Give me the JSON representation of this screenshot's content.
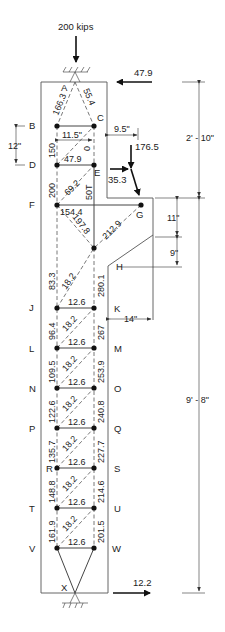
{
  "diagram": {
    "loads": {
      "top_axial": "200 kips",
      "top_horizontal": "47.9",
      "corbel_vertical": "176.5",
      "corbel_horizontal": "35.3",
      "bottom_horizontal": "12.2"
    },
    "dimensions": {
      "bc_spacing": "11.5\"",
      "bd_spacing": "12\"",
      "corbel_offset": "9.5\"",
      "upper_height": "2' - 10\"",
      "corbel_depth_top": "11\"",
      "corbel_depth_slope": "9\"",
      "corbel_width": "14\"",
      "lower_height": "9' - 8\""
    },
    "nodes": {
      "A": "A",
      "B": "B",
      "C": "C",
      "D": "D",
      "E": "E",
      "F": "F",
      "G": "G",
      "H": "H",
      "J": "J",
      "K": "K",
      "L": "L",
      "M": "M",
      "N": "N",
      "O": "O",
      "P": "P",
      "Q": "Q",
      "R": "R",
      "S": "S",
      "T": "T",
      "U": "U",
      "V": "V",
      "W": "W",
      "X": "X"
    },
    "members": {
      "AB": "166.3",
      "AC": "55.4",
      "BD": "150",
      "CE": "0",
      "DE": "47.9",
      "DF": "200",
      "E_diag": "69.2",
      "E_vert": "50T",
      "FG": "154.4",
      "F_diag": "197.8",
      "G_diag": "212.9",
      "FJ": "83.3",
      "node_K": "280.1",
      "JK_diag": "18.2",
      "JK": "12.6",
      "JL": "96.4",
      "KM": "267",
      "LM_diag": "18.2",
      "LM": "12.6",
      "LN": "109.5",
      "MO": "253.9",
      "NO_diag": "18.2",
      "NO": "12.6",
      "NP": "122.6",
      "OQ": "240.8",
      "PQ_diag": "18.2",
      "PQ": "12.6",
      "PR": "135.7",
      "QS": "227.7",
      "RS_diag": "18.2",
      "RS": "12.6",
      "RT": "148.8",
      "SU": "214.6",
      "TU_diag": "18.2",
      "TU": "12.6",
      "TV": "161.9",
      "UW": "201.5",
      "VW_diag": "18.2",
      "VW": "12.6"
    }
  }
}
